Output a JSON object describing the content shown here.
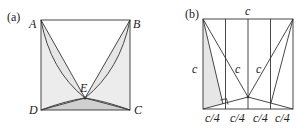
{
  "panel_a": {
    "tag": "(a)",
    "vertices": {
      "A": "A",
      "B": "B",
      "C": "C",
      "D": "D",
      "E": "E"
    }
  },
  "panel_b": {
    "tag": "(b)",
    "top_label": "c",
    "left_label": "c",
    "inner_left_label": "c",
    "inner_right_label": "c",
    "bottom_labels": [
      "c/4",
      "c/4",
      "c/4",
      "c/4"
    ]
  },
  "colors": {
    "shade": "#e6e6e6",
    "shade_dark": "#d0d0d0",
    "line": "#333333"
  }
}
